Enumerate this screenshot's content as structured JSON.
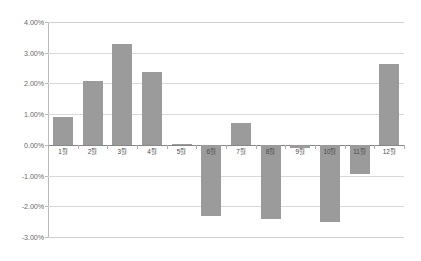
{
  "chart_data": {
    "type": "bar",
    "title": "",
    "subtitle": "",
    "xlabel": "",
    "ylabel": "",
    "categories": [
      "1월",
      "2월",
      "3월",
      "4월",
      "5월",
      "6월",
      "7월",
      "8월",
      "9월",
      "10월",
      "11월",
      "12월"
    ],
    "values": [
      0.9,
      2.07,
      3.27,
      2.38,
      0.03,
      -2.33,
      0.7,
      -2.4,
      -0.1,
      -2.52,
      -0.95,
      2.64
    ],
    "value_unit": "%",
    "ylim": [
      -3.0,
      4.0
    ],
    "ytick_values": [
      4.0,
      3.0,
      2.0,
      1.0,
      0.0,
      -1.0,
      -2.0,
      -3.0
    ],
    "ytick_labels": [
      "4.00%",
      "3.00%",
      "2.00%",
      "1.00%",
      "0.00%",
      "-1.00%",
      "-2.00%",
      "-3.00%"
    ],
    "grid": true,
    "legend": false,
    "legend_position": "none",
    "series": [
      {
        "name": "",
        "color": "#9b9b9b",
        "values": [
          0.9,
          2.07,
          3.27,
          2.38,
          0.03,
          -2.33,
          0.7,
          -2.4,
          -0.1,
          -2.52,
          -0.95,
          2.64
        ]
      }
    ]
  },
  "colors": {
    "bar": "#9b9b9b",
    "grid": "#d9d9d9",
    "zero_axis": "#868686",
    "axis": "#b9b9b9",
    "tick_text": "#6a6a6a",
    "category_text": "#4a4a4a",
    "background": "#ffffff"
  }
}
